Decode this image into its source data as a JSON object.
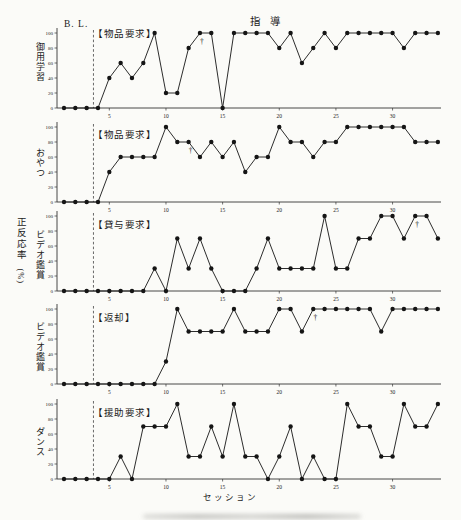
{
  "figure": {
    "baseline_label": "B. L.",
    "instruction_label": "指　導",
    "y_axis_label": "正反応率",
    "y_axis_unit": "(%)",
    "x_axis_label": "セッション",
    "n_sessions": 34,
    "baseline_sessions": 3,
    "phase_divider_after_session": 3.6,
    "x_ticks": [
      5,
      10,
      15,
      20,
      25,
      30
    ],
    "y_ticks": [
      0,
      20,
      40,
      60,
      80,
      100
    ],
    "marker_symbol": "†",
    "line_color": "#151515",
    "background_color": "#fbfbf8"
  },
  "chart_data": [
    {
      "type": "line",
      "title": "【物品要求】",
      "ylabel": "御用学習",
      "ylim": [
        0,
        100
      ],
      "values": [
        0,
        0,
        0,
        0,
        40,
        60,
        40,
        60,
        100,
        20,
        20,
        80,
        100,
        100,
        0,
        100,
        100,
        100,
        100,
        80,
        100,
        60,
        80,
        100,
        80,
        100,
        100,
        100,
        100,
        100,
        80,
        100,
        100,
        100
      ],
      "dagger_session": 13
    },
    {
      "type": "line",
      "title": "【物品要求】",
      "ylabel": "おやつ",
      "ylim": [
        0,
        100
      ],
      "values": [
        0,
        0,
        0,
        0,
        40,
        60,
        60,
        60,
        60,
        100,
        80,
        80,
        60,
        80,
        60,
        80,
        40,
        60,
        60,
        100,
        80,
        80,
        60,
        80,
        80,
        100,
        100,
        100,
        100,
        100,
        100,
        80,
        80,
        80
      ],
      "dagger_session": 12
    },
    {
      "type": "line",
      "title": "【貸与要求】",
      "ylabel": "ビデオ鑑賞",
      "ylim": [
        0,
        100
      ],
      "values": [
        0,
        0,
        0,
        0,
        0,
        0,
        0,
        0,
        30,
        0,
        70,
        30,
        70,
        30,
        0,
        0,
        0,
        30,
        70,
        30,
        30,
        30,
        30,
        100,
        30,
        30,
        70,
        70,
        100,
        100,
        70,
        100,
        100,
        70
      ],
      "dagger_session": 32
    },
    {
      "type": "line",
      "title": "【返却】",
      "ylabel": "ビデオ鑑賞",
      "ylim": [
        0,
        100
      ],
      "values": [
        0,
        0,
        0,
        0,
        0,
        0,
        0,
        0,
        0,
        30,
        100,
        70,
        70,
        70,
        70,
        100,
        70,
        70,
        70,
        100,
        100,
        70,
        100,
        100,
        100,
        100,
        100,
        100,
        70,
        100,
        100,
        100,
        100,
        100
      ],
      "dagger_session": 23
    },
    {
      "type": "line",
      "title": "【援助要求】",
      "ylabel": "ダンス",
      "ylim": [
        0,
        100
      ],
      "values": [
        0,
        0,
        0,
        0,
        0,
        30,
        0,
        70,
        70,
        70,
        100,
        30,
        30,
        70,
        30,
        100,
        30,
        30,
        0,
        30,
        70,
        0,
        30,
        0,
        0,
        100,
        70,
        70,
        30,
        30,
        100,
        70,
        70,
        100
      ],
      "dagger_session": null
    }
  ]
}
